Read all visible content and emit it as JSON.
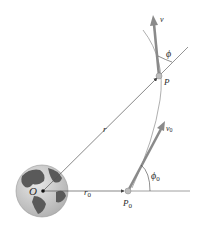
{
  "diagram": {
    "type": "orbital-motion",
    "labels": {
      "origin": "O",
      "radius": "r",
      "radius_initial": "r",
      "radius_initial_sub": "0",
      "point": "P",
      "point_initial": "P",
      "point_initial_sub": "0",
      "velocity": "v",
      "velocity_initial": "v",
      "velocity_initial_sub": "0",
      "angle": "ϕ",
      "angle_initial": "ϕ",
      "angle_initial_sub": "0"
    },
    "colors": {
      "arrow": "#8a8a8a",
      "line": "#555555",
      "path": "#9a9a9a",
      "earth_ocean": "#cfcfcf",
      "earth_land": "#5a5a5a"
    }
  }
}
